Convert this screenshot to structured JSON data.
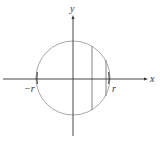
{
  "diagram": {
    "labels": {
      "y_axis": "y",
      "x_axis": "x",
      "neg_r": "−r",
      "pos_r": "r"
    },
    "colors": {
      "axis": "#333333",
      "circle": "#a8a8a8",
      "chord": "#777777",
      "arc_highlight": "#555555"
    },
    "circle": {
      "cx": 73,
      "cy": 78,
      "r": 37
    },
    "chords": [
      {
        "x": 92,
        "y1": 46,
        "y2": 110
      },
      {
        "x": 106,
        "y1": 60,
        "y2": 96
      }
    ]
  }
}
